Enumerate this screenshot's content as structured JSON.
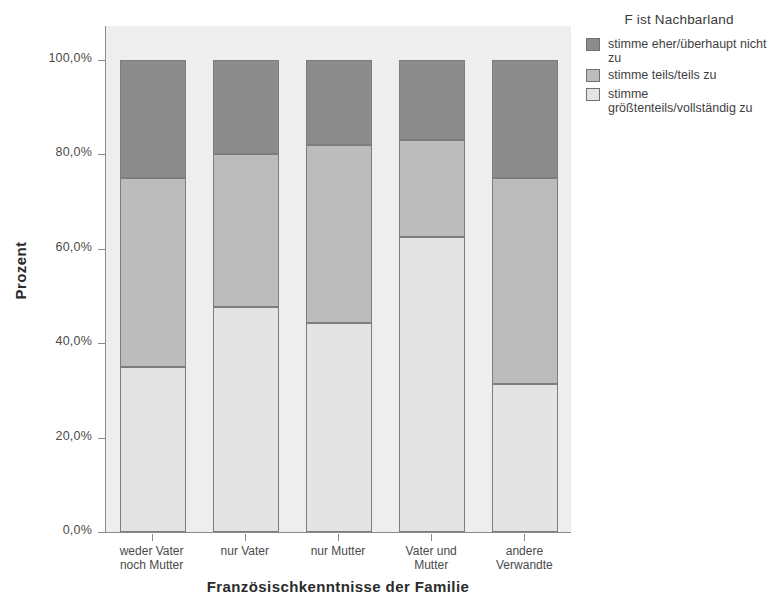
{
  "chart_data": {
    "type": "bar",
    "subtype": "stacked-percent",
    "title": "",
    "xlabel": "Französischkenntnisse der Familie",
    "ylabel": "Prozent",
    "ylim": [
      0,
      100
    ],
    "grid": false,
    "legend_position": "right",
    "legend_title": "F ist Nachbarland",
    "categories": [
      "weder Vater\nnoch Mutter",
      "nur Vater",
      "nur Mutter",
      "Vater und\nMutter",
      "andere\nVerwandte"
    ],
    "y_ticks": [
      "0,0%",
      "20,0%",
      "40,0%",
      "60,0%",
      "80,0%",
      "100,0%"
    ],
    "y_tick_values": [
      0,
      20,
      40,
      60,
      80,
      100
    ],
    "series": [
      {
        "name": "stimme größtenteils/vollständig zu",
        "color": "#e4e4e4",
        "values": [
          35.0,
          47.7,
          44.3,
          62.6,
          31.3
        ]
      },
      {
        "name": "stimme teils/teils zu",
        "color": "#bcbcbc",
        "values": [
          40.0,
          32.3,
          37.7,
          20.4,
          43.7
        ]
      },
      {
        "name": "stimme eher/überhaupt nicht zu",
        "color": "#8c8c8c",
        "values": [
          25.0,
          20.0,
          18.0,
          17.0,
          25.0
        ]
      }
    ],
    "cumulative_tops": [
      [
        35.0,
        75.0,
        100.0
      ],
      [
        47.7,
        80.0,
        100.0
      ],
      [
        44.3,
        82.0,
        100.0
      ],
      [
        62.6,
        83.0,
        100.0
      ],
      [
        31.3,
        75.0,
        100.0
      ]
    ]
  },
  "legend": {
    "title": "F ist Nachbarland",
    "entries": [
      {
        "label": "stimme eher/überhaupt nicht\nzu",
        "swatch": "s0"
      },
      {
        "label": "stimme teils/teils zu",
        "swatch": "s1"
      },
      {
        "label": "stimme\ngrößtenteils/vollständig zu",
        "swatch": "s2"
      }
    ]
  },
  "axes": {
    "y_title": "Prozent",
    "x_title": "Französischkenntnisse der Familie"
  },
  "colors": {
    "plot_background": "#eeeeee",
    "axis_line": "#8a8a8a",
    "segment_dark": "#8c8c8c",
    "segment_medium": "#bcbcbc",
    "segment_light": "#e4e4e4"
  }
}
